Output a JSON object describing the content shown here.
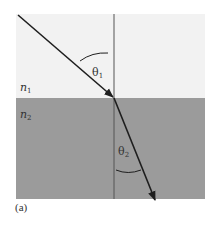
{
  "figure": {
    "caption": "(a)",
    "colors": {
      "medium1": "#f2f2f2",
      "medium2": "#9b9b9b",
      "ray": "#1e1e1e",
      "normal": "#555555",
      "text": "#333333"
    },
    "media": [
      {
        "id": "medium1",
        "label_base": "n",
        "label_sub": "1"
      },
      {
        "id": "medium2",
        "label_base": "n",
        "label_sub": "2"
      }
    ],
    "angles": [
      {
        "id": "theta1",
        "label_base": "θ",
        "label_sub": "1",
        "description": "angle of incidence"
      },
      {
        "id": "theta2",
        "label_base": "θ",
        "label_sub": "2",
        "description": "angle of refraction"
      }
    ],
    "rays": [
      {
        "id": "incident-ray",
        "from": [
          18,
          15
        ],
        "to": [
          114,
          98
        ]
      },
      {
        "id": "refracted-ray",
        "from": [
          114,
          98
        ],
        "to": [
          155,
          200
        ]
      }
    ],
    "normal_line": {
      "x": 114,
      "y_top": 14,
      "y_bottom": 199
    },
    "interface_y": 98
  }
}
